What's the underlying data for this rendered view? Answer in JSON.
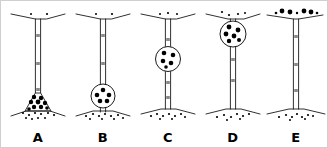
{
  "figure": {
    "background_color": "#ffffff",
    "ink_color": "#1a1a1a",
    "dot_color": "#000000",
    "border_color": "#cfcfcf",
    "width": 328,
    "height": 148
  },
  "panels": [
    {
      "label": "A",
      "x": 4,
      "vesicle": {
        "present": true,
        "shape": "cone",
        "cx": 33,
        "cy": 104,
        "r": 13,
        "dot_count": 9
      },
      "vesicle_dots": [
        {
          "x": 29,
          "y": 96,
          "r": 2.2
        },
        {
          "x": 36,
          "y": 97,
          "r": 2.2
        },
        {
          "x": 26,
          "y": 101,
          "r": 2.2
        },
        {
          "x": 33,
          "y": 101,
          "r": 2.4
        },
        {
          "x": 40,
          "y": 102,
          "r": 2.2
        },
        {
          "x": 29,
          "y": 106,
          "r": 2.2
        },
        {
          "x": 36,
          "y": 106,
          "r": 2.2
        },
        {
          "x": 24,
          "y": 108,
          "r": 1.8
        },
        {
          "x": 42,
          "y": 107,
          "r": 1.8
        }
      ],
      "free_dots_bottom": [
        {
          "x": 18,
          "y": 112,
          "r": 1.1
        },
        {
          "x": 24,
          "y": 114,
          "r": 1.1
        },
        {
          "x": 30,
          "y": 112,
          "r": 1.1
        },
        {
          "x": 36,
          "y": 113,
          "r": 1.1
        },
        {
          "x": 43,
          "y": 112,
          "r": 1.1
        },
        {
          "x": 49,
          "y": 114,
          "r": 1.1
        },
        {
          "x": 21,
          "y": 117,
          "r": 1.0
        },
        {
          "x": 33,
          "y": 117,
          "r": 1.0
        },
        {
          "x": 40,
          "y": 117,
          "r": 1.0
        },
        {
          "x": 27,
          "y": 118,
          "r": 1.0
        }
      ],
      "free_dots_top": [
        {
          "x": 26,
          "y": 13,
          "r": 1.0
        },
        {
          "x": 42,
          "y": 13,
          "r": 1.1
        }
      ]
    },
    {
      "label": "B",
      "x": 69,
      "vesicle": {
        "present": true,
        "shape": "circle",
        "cx": 33,
        "cy": 95,
        "r": 12,
        "dot_count": 5
      },
      "vesicle_dots": [
        {
          "x": 33,
          "y": 89,
          "r": 2.3
        },
        {
          "x": 27,
          "y": 94,
          "r": 2.3
        },
        {
          "x": 39,
          "y": 94,
          "r": 2.3
        },
        {
          "x": 30,
          "y": 100,
          "r": 2.3
        },
        {
          "x": 37,
          "y": 100,
          "r": 2.3
        }
      ],
      "free_dots_bottom": [
        {
          "x": 16,
          "y": 115,
          "r": 1.1
        },
        {
          "x": 23,
          "y": 113,
          "r": 1.1
        },
        {
          "x": 29,
          "y": 115,
          "r": 1.1
        },
        {
          "x": 35,
          "y": 113,
          "r": 1.1
        },
        {
          "x": 41,
          "y": 115,
          "r": 1.1
        },
        {
          "x": 48,
          "y": 114,
          "r": 1.1
        },
        {
          "x": 20,
          "y": 118,
          "r": 1.0
        },
        {
          "x": 32,
          "y": 118,
          "r": 1.0
        },
        {
          "x": 44,
          "y": 118,
          "r": 1.0
        },
        {
          "x": 53,
          "y": 117,
          "r": 1.0
        }
      ],
      "free_dots_top": [
        {
          "x": 26,
          "y": 13,
          "r": 1.0
        },
        {
          "x": 42,
          "y": 13,
          "r": 1.1
        }
      ]
    },
    {
      "label": "C",
      "x": 134,
      "vesicle": {
        "present": true,
        "shape": "circle",
        "cx": 33,
        "cy": 58,
        "r": 12.5,
        "dot_count": 5
      },
      "vesicle_dots": [
        {
          "x": 29,
          "y": 52,
          "r": 2.3
        },
        {
          "x": 38,
          "y": 54,
          "r": 2.3
        },
        {
          "x": 28,
          "y": 60,
          "r": 2.3
        },
        {
          "x": 36,
          "y": 62,
          "r": 2.3
        },
        {
          "x": 31,
          "y": 66,
          "r": 1.8
        }
      ],
      "free_dots_bottom": [
        {
          "x": 16,
          "y": 115,
          "r": 1.1
        },
        {
          "x": 22,
          "y": 113,
          "r": 1.1
        },
        {
          "x": 28,
          "y": 115,
          "r": 1.1
        },
        {
          "x": 34,
          "y": 113,
          "r": 1.1
        },
        {
          "x": 40,
          "y": 115,
          "r": 1.1
        },
        {
          "x": 46,
          "y": 113,
          "r": 1.1
        },
        {
          "x": 25,
          "y": 118,
          "r": 1.0
        },
        {
          "x": 37,
          "y": 118,
          "r": 1.0
        },
        {
          "x": 50,
          "y": 116,
          "r": 1.0
        }
      ],
      "free_dots_top": [
        {
          "x": 25,
          "y": 13,
          "r": 1.0
        },
        {
          "x": 33,
          "y": 12,
          "r": 1.1
        },
        {
          "x": 42,
          "y": 13,
          "r": 1.0
        }
      ]
    },
    {
      "label": "D",
      "x": 199,
      "vesicle": {
        "present": true,
        "shape": "circle",
        "cx": 33,
        "cy": 33,
        "r": 13,
        "dot_count": 6
      },
      "vesicle_dots": [
        {
          "x": 29,
          "y": 26,
          "r": 2.4
        },
        {
          "x": 38,
          "y": 29,
          "r": 2.4
        },
        {
          "x": 26,
          "y": 33,
          "r": 2.4
        },
        {
          "x": 34,
          "y": 35,
          "r": 2.4
        },
        {
          "x": 29,
          "y": 40,
          "r": 2.2
        },
        {
          "x": 39,
          "y": 39,
          "r": 2.0
        }
      ],
      "free_dots_bottom": [
        {
          "x": 17,
          "y": 116,
          "r": 1.1
        },
        {
          "x": 24,
          "y": 114,
          "r": 1.1
        },
        {
          "x": 31,
          "y": 116,
          "r": 1.1
        },
        {
          "x": 37,
          "y": 113,
          "r": 1.1
        },
        {
          "x": 43,
          "y": 115,
          "r": 1.1
        },
        {
          "x": 49,
          "y": 113,
          "r": 1.1
        },
        {
          "x": 27,
          "y": 119,
          "r": 1.0
        },
        {
          "x": 40,
          "y": 118,
          "r": 1.0
        }
      ],
      "free_dots_top": [
        {
          "x": 22,
          "y": 11,
          "r": 1.1
        },
        {
          "x": 29,
          "y": 14,
          "r": 1.1
        },
        {
          "x": 38,
          "y": 13,
          "r": 1.1
        },
        {
          "x": 45,
          "y": 12,
          "r": 1.0
        }
      ]
    },
    {
      "label": "E",
      "x": 262,
      "vesicle": {
        "present": false,
        "shape": "none",
        "cx": 0,
        "cy": 0,
        "r": 0,
        "dot_count": 0
      },
      "vesicle_dots": [],
      "free_dots_bottom": [
        {
          "x": 16,
          "y": 116,
          "r": 1.1
        },
        {
          "x": 23,
          "y": 114,
          "r": 1.1
        },
        {
          "x": 29,
          "y": 116,
          "r": 1.1
        },
        {
          "x": 34,
          "y": 113,
          "r": 1.1
        },
        {
          "x": 39,
          "y": 116,
          "r": 1.1
        },
        {
          "x": 45,
          "y": 114,
          "r": 1.1
        },
        {
          "x": 27,
          "y": 119,
          "r": 1.0
        },
        {
          "x": 42,
          "y": 118,
          "r": 1.0
        },
        {
          "x": 50,
          "y": 115,
          "r": 1.0
        }
      ],
      "free_dots_top": [
        {
          "x": 13,
          "y": 12,
          "r": 1.3
        },
        {
          "x": 19,
          "y": 10,
          "r": 2.4
        },
        {
          "x": 27,
          "y": 11,
          "r": 2.4
        },
        {
          "x": 34,
          "y": 12,
          "r": 1.2
        },
        {
          "x": 41,
          "y": 10,
          "r": 2.4
        },
        {
          "x": 48,
          "y": 11,
          "r": 2.4
        },
        {
          "x": 54,
          "y": 12,
          "r": 1.3
        }
      ]
    }
  ],
  "tube": {
    "top_y": 18,
    "bottom_y": 108,
    "half_width": 2.6,
    "tick_ys": [
      34,
      62,
      88
    ],
    "top_branch": {
      "y": 18,
      "left_x": 6,
      "right_x": 60,
      "drop": 5
    },
    "bottom_branch": {
      "y": 108,
      "left_x": 6,
      "right_x": 60,
      "drop": -5
    }
  }
}
